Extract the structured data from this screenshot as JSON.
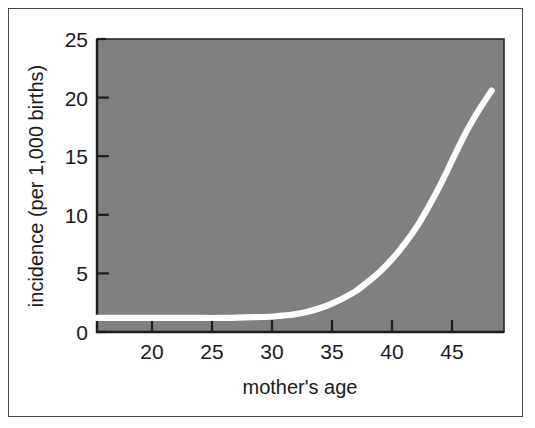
{
  "chart_data": {
    "type": "line",
    "title": "",
    "subtitle": "",
    "xlabel": "mother's age",
    "ylabel": "incidence (per 1,000 births)",
    "xlim": [
      16,
      49
    ],
    "ylim": [
      0,
      25
    ],
    "xticks": [
      20,
      25,
      30,
      35,
      40,
      45
    ],
    "xtick_labels": [
      "20",
      "25",
      "30",
      "35",
      "40",
      "45"
    ],
    "yticks": [
      0,
      5,
      10,
      15,
      20,
      25
    ],
    "ytick_labels": [
      "0",
      "5",
      "10",
      "15",
      "20",
      "25"
    ],
    "grid": false,
    "legend": null,
    "plot_background_color": "#808080",
    "line_color": "#ffffff",
    "series": [
      {
        "name": "incidence",
        "x": [
          16,
          18,
          20,
          22,
          24,
          26,
          28,
          30,
          31,
          32,
          33,
          34,
          35,
          36,
          37,
          38,
          39,
          40,
          41,
          42,
          43,
          44,
          45,
          46,
          47,
          48
        ],
        "values": [
          1.2,
          1.2,
          1.2,
          1.2,
          1.2,
          1.2,
          1.25,
          1.3,
          1.4,
          1.5,
          1.7,
          2.0,
          2.4,
          2.9,
          3.5,
          4.3,
          5.2,
          6.3,
          7.6,
          9.1,
          10.9,
          12.9,
          15.1,
          17.2,
          19.0,
          20.6
        ]
      }
    ],
    "annotations": []
  },
  "axis": {
    "y_title": "incidence (per 1,000 births)",
    "x_title": "mother's age",
    "y_labels": [
      "25",
      "20",
      "15",
      "10",
      "5",
      "0"
    ],
    "x_labels": [
      "20",
      "25",
      "30",
      "35",
      "40",
      "45"
    ]
  }
}
